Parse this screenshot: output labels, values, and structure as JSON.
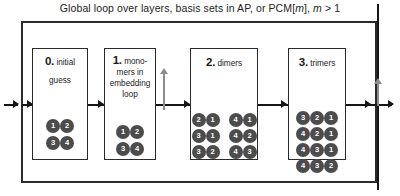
{
  "figure": {
    "title_prefix": "Global loop over layers, basis sets in AP, or PCM[",
    "title_italic_1": "m",
    "title_middle": "], ",
    "title_italic_2": "m",
    "title_suffix": " > 1",
    "title_full": "Global loop over layers, basis sets in AP, or PCM[m], m > 1"
  },
  "stages": [
    {
      "number": "0.",
      "label_line1": "initial",
      "label_line2": "guess",
      "rows": [
        {
          "groups": [
            [
              "1",
              "2"
            ]
          ]
        },
        {
          "groups": [
            [
              "3",
              "4"
            ]
          ]
        }
      ]
    },
    {
      "number": "1.",
      "label_line1": "mono-",
      "label_line2": "mers in",
      "label_line3": "embedding",
      "label_line4": "loop",
      "rows": [
        {
          "groups": [
            [
              "1",
              "2"
            ]
          ]
        },
        {
          "groups": [
            [
              "3",
              "4"
            ]
          ]
        }
      ]
    },
    {
      "number": "2.",
      "label_line1": "dimers",
      "rows": [
        {
          "groups": [
            [
              "2",
              "1"
            ],
            [
              "4",
              "1"
            ]
          ]
        },
        {
          "groups": [
            [
              "3",
              "1"
            ],
            [
              "4",
              "2"
            ]
          ]
        },
        {
          "groups": [
            [
              "3",
              "2"
            ],
            [
              "4",
              "3"
            ]
          ]
        }
      ]
    },
    {
      "number": "3.",
      "label_line1": "trimers",
      "rows": [
        {
          "groups": [
            [
              "3",
              "2",
              "1"
            ]
          ]
        },
        {
          "groups": [
            [
              "4",
              "2",
              "1"
            ]
          ]
        },
        {
          "groups": [
            [
              "4",
              "3",
              "1"
            ]
          ]
        },
        {
          "groups": [
            [
              "4",
              "3",
              "2"
            ]
          ]
        }
      ]
    }
  ],
  "colors": {
    "node_fill": "#4c4c4c",
    "node_text": "#ffffff",
    "frame": "#2b2b2b",
    "flow_arrow": "#151515",
    "loop_arrow": "#8c8c8c",
    "background": "#ffffff"
  }
}
